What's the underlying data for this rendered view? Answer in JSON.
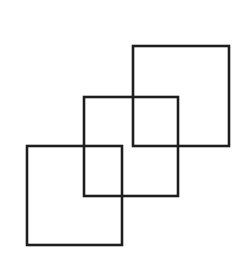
{
  "canvas": {
    "width": 252,
    "height": 263,
    "background": "#ffffff"
  },
  "stroke": {
    "color": "#1e1e1e",
    "width": 2.6
  },
  "squares": [
    {
      "id": "top-right",
      "x": 133,
      "y": 46,
      "w": 96,
      "h": 100
    },
    {
      "id": "middle",
      "x": 84,
      "y": 97,
      "w": 94,
      "h": 99
    },
    {
      "id": "bottom-left",
      "x": 27,
      "y": 146,
      "w": 95,
      "h": 99
    }
  ]
}
